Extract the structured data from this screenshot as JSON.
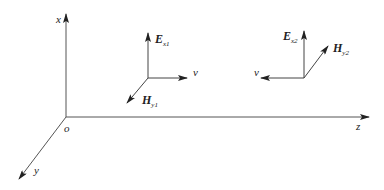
{
  "diagram": {
    "type": "3d-coordinate-diagram",
    "axes": {
      "origin_label": "o",
      "x_label": "x",
      "y_label": "y",
      "z_label": "z"
    },
    "wave1": {
      "E_label": "E",
      "E_sub": "x1",
      "H_label": "H",
      "H_sub": "y1",
      "v_label": "v",
      "v_direction": "+z"
    },
    "wave2": {
      "E_label": "E",
      "E_sub": "x2",
      "H_label": "H",
      "H_sub": "y2",
      "v_label": "v",
      "v_direction": "-z"
    },
    "colors": {
      "line": "#333333",
      "background": "#ffffff"
    }
  }
}
